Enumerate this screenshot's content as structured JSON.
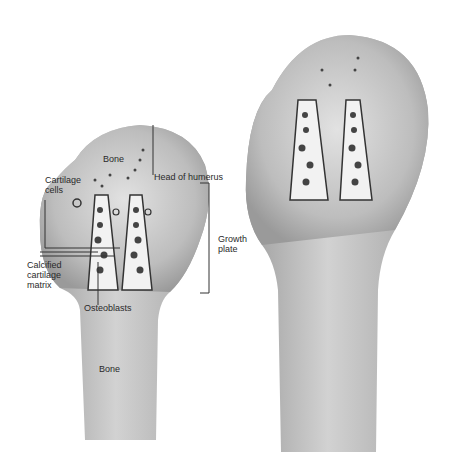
{
  "diagram": {
    "left_bone": {
      "labels": {
        "bone_top": "Bone",
        "head": "Head of humerus",
        "cartilage_line1": "Cartilage",
        "cartilage_line2": "cells",
        "growth_line1": "Growth",
        "growth_line2": "plate",
        "calcified_line1": "Calcified",
        "calcified_line2": "cartilage",
        "calcified_line3": "matrix",
        "osteoblasts": "Osteoblasts",
        "bone_shaft": "Bone"
      }
    },
    "right_bone": {
      "labels": {}
    },
    "colors": {
      "bone_fill": "#b8b8b8",
      "bone_light": "#d6d6d6",
      "cell_dark": "#3a3a3a",
      "line": "#333333"
    }
  }
}
